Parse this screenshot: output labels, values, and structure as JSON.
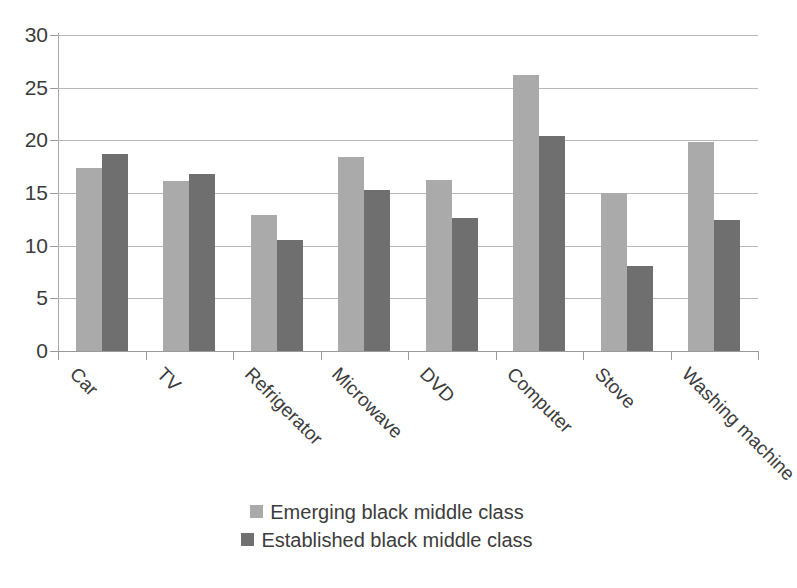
{
  "chart_data": {
    "type": "bar",
    "title": "",
    "subtitle": "",
    "xlabel": "",
    "ylabel": "",
    "ylim": [
      0,
      30
    ],
    "ytick_step": 5,
    "yticks": [
      0,
      5,
      10,
      15,
      20,
      25,
      30
    ],
    "ytick_labels": [
      "0",
      "5",
      "10",
      "15",
      "20",
      "25",
      "30"
    ],
    "grid": true,
    "grid_axis": "y",
    "legend_position": "bottom",
    "categories": [
      "Car",
      "TV",
      "Refrigerator",
      "Microwave",
      "DVD",
      "Computer",
      "Stove",
      "Washing machine"
    ],
    "series": [
      {
        "name": "Emerging black middle class",
        "color": "#aaaaaa",
        "values": [
          17.4,
          16.1,
          12.9,
          18.4,
          16.2,
          26.2,
          15.0,
          19.8
        ]
      },
      {
        "name": "Established black middle class",
        "color": "#6f6f6f",
        "values": [
          18.7,
          16.8,
          10.5,
          15.3,
          12.6,
          20.4,
          8.1,
          12.4
        ]
      }
    ]
  },
  "legend": {
    "entries": [
      {
        "label": "Emerging black middle class",
        "color": "#aaaaaa"
      },
      {
        "label": "Established black middle class",
        "color": "#6f6f6f"
      }
    ]
  },
  "colors": {
    "series_light": "#aaaaaa",
    "series_dark": "#6f6f6f",
    "grid": "#b9b9b9",
    "axis": "#9a9a9a",
    "text": "#3c3c3c",
    "background": "#ffffff"
  }
}
